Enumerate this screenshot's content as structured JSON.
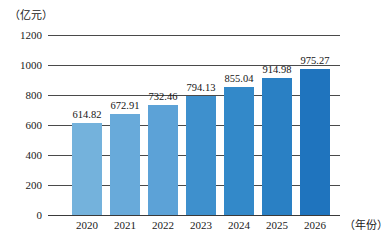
{
  "chart_data": {
    "type": "bar",
    "title": "",
    "subtitle": "",
    "xlabel": "（年份）",
    "ylabel": "（亿元）",
    "categories": [
      "2020",
      "2021",
      "2022",
      "2023",
      "2024",
      "2025",
      "2026"
    ],
    "values": [
      614.82,
      672.91,
      732.46,
      794.13,
      855.04,
      914.98,
      975.27
    ],
    "value_labels": [
      "614.82",
      "672.91",
      "732.46",
      "794.13",
      "855.04",
      "914.98",
      "975.27"
    ],
    "ylim": [
      0,
      1200
    ],
    "yticks": [
      1200,
      1000,
      800,
      600,
      400,
      200,
      0
    ],
    "ytick_labels": [
      "1200",
      "1000",
      "800",
      "600",
      "400",
      "200",
      "0"
    ],
    "grid": true,
    "legend": null,
    "legend_position": "none",
    "annotations": [],
    "bar_colors": [
      "#74B2DC",
      "#68AADA",
      "#5CA2D7",
      "#3E90CD",
      "#3389C9",
      "#2A80C4",
      "#1F74BE"
    ],
    "gridline_color": "#4a4a4a",
    "axis_color": "#3a3a3a",
    "label_text_color": "#151515"
  }
}
